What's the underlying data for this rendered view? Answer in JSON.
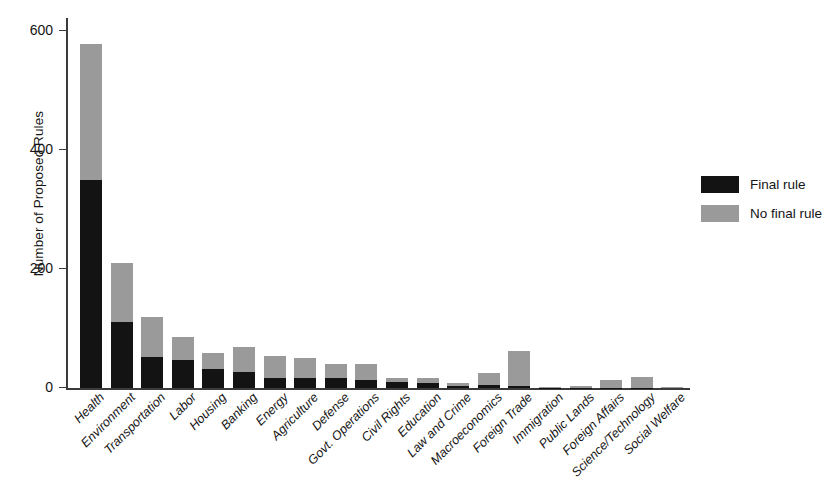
{
  "chart_data": {
    "type": "bar",
    "subtype": "stacked-vertical",
    "title": "",
    "xlabel": "",
    "ylabel": "Number of Proposed Rules",
    "ylim": [
      0,
      620
    ],
    "yticks": [
      0,
      200,
      400,
      600
    ],
    "ytick_labels": [
      "0",
      "200",
      "400",
      "600"
    ],
    "grid": false,
    "legend_position": "right",
    "categories": [
      "Health",
      "Environment",
      "Transportation",
      "Labor",
      "Housing",
      "Banking",
      "Energy",
      "Agriculture",
      "Defense",
      "Govt. Operations",
      "Civil Rights",
      "Education",
      "Law and Crime",
      "Macroeconomics",
      "Foreign Trade",
      "Immigration",
      "Public Lands",
      "Foreign Affairs",
      "Science/Technology",
      "Social Welfare"
    ],
    "series": [
      {
        "name": "Final rule",
        "color": "#131313",
        "values": [
          350,
          112,
          52,
          48,
          33,
          27,
          17,
          17,
          17,
          13,
          10,
          8,
          4,
          5,
          4,
          1,
          1,
          1,
          1,
          0
        ]
      },
      {
        "name": "No final rule",
        "color": "#9a9a9a",
        "values": [
          228,
          99,
          68,
          38,
          26,
          43,
          37,
          34,
          23,
          28,
          7,
          10,
          5,
          20,
          58,
          1,
          3,
          13,
          18,
          2
        ]
      }
    ],
    "totals": [
      578,
      211,
      120,
      86,
      59,
      70,
      54,
      51,
      40,
      41,
      17,
      18,
      9,
      25,
      62,
      2,
      4,
      14,
      19,
      2
    ]
  },
  "legend": {
    "items": [
      {
        "label": "Final rule",
        "color": "#131313"
      },
      {
        "label": "No final rule",
        "color": "#9a9a9a"
      }
    ]
  }
}
